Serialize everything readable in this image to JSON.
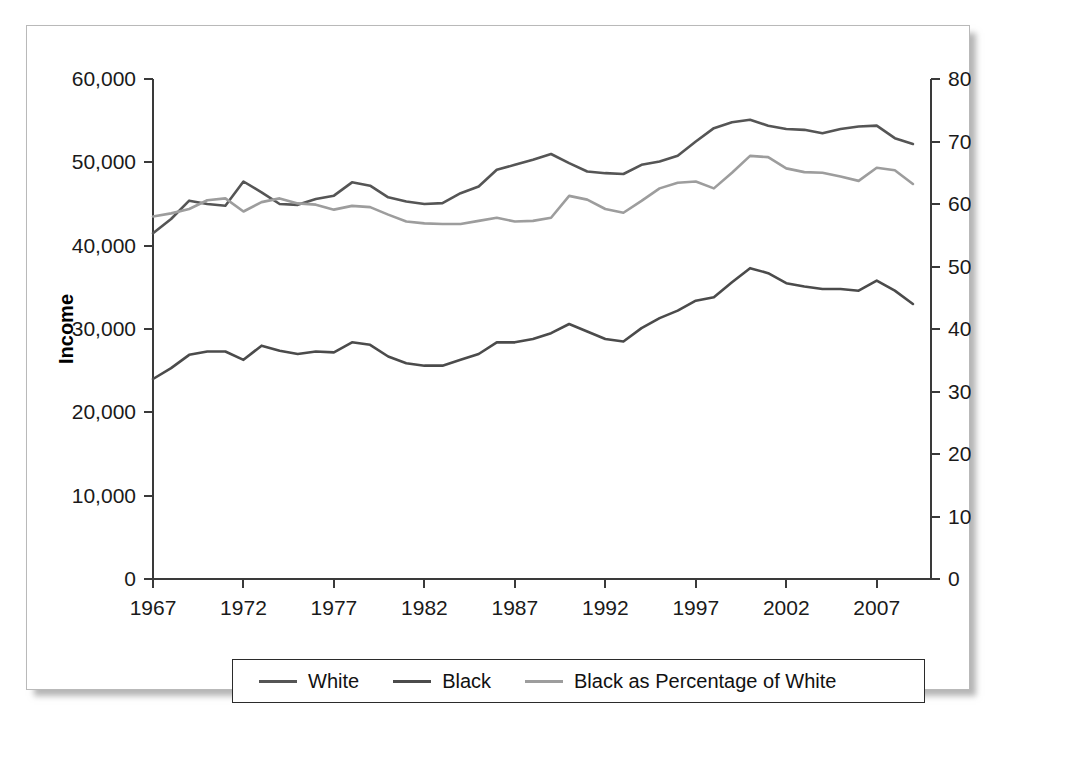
{
  "figure": {
    "background_color": "#ffffff",
    "border_color": "#b9b9b9"
  },
  "chart_data": {
    "type": "line",
    "title": "",
    "xlabel": "",
    "ylabel": "Income",
    "y2label": "Percentage",
    "grid": false,
    "legend_position": "bottom",
    "xlim": [
      1967,
      2010
    ],
    "ylim": [
      0,
      60000
    ],
    "y2lim": [
      0,
      80
    ],
    "x": [
      1967,
      1968,
      1969,
      1970,
      1971,
      1972,
      1973,
      1974,
      1975,
      1976,
      1977,
      1978,
      1979,
      1980,
      1981,
      1982,
      1983,
      1984,
      1985,
      1986,
      1987,
      1988,
      1989,
      1990,
      1991,
      1992,
      1993,
      1994,
      1995,
      1996,
      1997,
      1998,
      1999,
      2000,
      2001,
      2002,
      2003,
      2004,
      2005,
      2006,
      2007,
      2008,
      2009
    ],
    "xticks": [
      1967,
      1972,
      1977,
      1982,
      1987,
      1992,
      1997,
      2002,
      2007
    ],
    "xticklabels": [
      "1967",
      "1972",
      "1977",
      "1982",
      "1987",
      "1992",
      "1997",
      "2002",
      "2007"
    ],
    "yticks": [
      0,
      10000,
      20000,
      30000,
      40000,
      50000,
      60000
    ],
    "yticklabels": [
      "0",
      "10,000",
      "20,000",
      "30,000",
      "40,000",
      "50,000",
      "60,000"
    ],
    "y2ticks": [
      0,
      10,
      20,
      30,
      40,
      50,
      60,
      70,
      80
    ],
    "y2ticklabels": [
      "0",
      "10",
      "20",
      "30",
      "40",
      "50",
      "60",
      "70",
      "80"
    ],
    "series": [
      {
        "name": "White",
        "axis": "left",
        "color": "#555555",
        "values": [
          41500,
          43200,
          45400,
          45000,
          44800,
          47700,
          46400,
          45000,
          44900,
          45600,
          46000,
          47600,
          47200,
          45800,
          45300,
          45000,
          45100,
          46300,
          47100,
          49100,
          49700,
          50300,
          51000,
          49900,
          48900,
          48700,
          48600,
          49700,
          50100,
          50800,
          52500,
          54100,
          54800,
          55100,
          54400,
          54000,
          53900,
          53500,
          54000,
          54300,
          54400,
          52900,
          52200
        ]
      },
      {
        "name": "Black",
        "axis": "left",
        "color": "#4b4b4b",
        "values": [
          24000,
          25300,
          26900,
          27300,
          27300,
          26300,
          28000,
          27400,
          27000,
          27300,
          27200,
          28400,
          28100,
          26700,
          25900,
          25600,
          25600,
          26300,
          27000,
          28400,
          28400,
          28800,
          29500,
          30600,
          29700,
          28800,
          28500,
          30100,
          31300,
          32200,
          33400,
          33800,
          35600,
          37300,
          36700,
          35500,
          35100,
          34800,
          34800,
          34600,
          35800,
          34600,
          33000
        ]
      },
      {
        "name": "Black as Percentage of White",
        "axis": "right",
        "color": "#9d9d9d",
        "values": [
          58.0,
          58.5,
          59.2,
          60.6,
          60.9,
          58.8,
          60.3,
          60.9,
          60.1,
          59.9,
          59.1,
          59.7,
          59.5,
          58.3,
          57.2,
          56.9,
          56.8,
          56.8,
          57.3,
          57.8,
          57.2,
          57.3,
          57.8,
          61.3,
          60.7,
          59.2,
          58.6,
          60.5,
          62.5,
          63.4,
          63.6,
          62.5,
          65.0,
          67.7,
          67.5,
          65.7,
          65.1,
          65.0,
          64.4,
          63.7,
          65.8,
          65.4,
          63.2
        ]
      }
    ]
  },
  "legend": {
    "entries": [
      {
        "label": "White",
        "color": "#555555"
      },
      {
        "label": "Black",
        "color": "#4b4b4b"
      },
      {
        "label": "Black as Percentage of White",
        "color": "#9d9d9d"
      }
    ]
  }
}
